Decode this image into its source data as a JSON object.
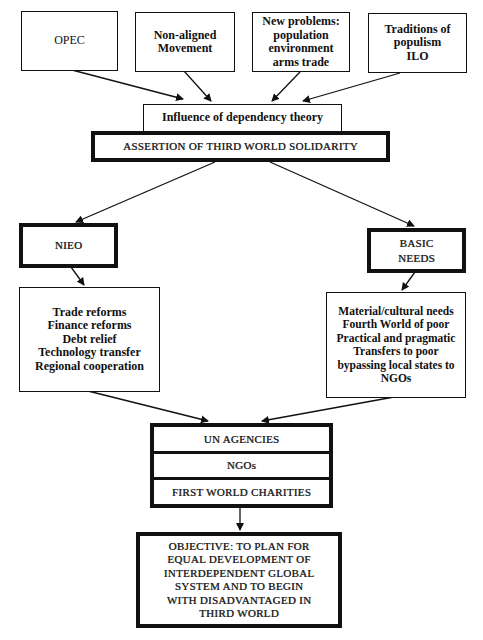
{
  "diagram": {
    "top_sources": [
      {
        "id": "opec",
        "lines": [
          "OPEC"
        ]
      },
      {
        "id": "non-aligned",
        "lines": [
          "Non-aligned",
          "Movement"
        ]
      },
      {
        "id": "new-problems",
        "lines": [
          "New problems:",
          "population",
          "environment",
          "arms trade"
        ]
      },
      {
        "id": "populism",
        "lines": [
          "Traditions of",
          "populism",
          "ILO"
        ]
      }
    ],
    "influence": {
      "label": "Influence of dependency theory"
    },
    "assertion": {
      "label": "ASSERTION OF THIRD WORLD SOLIDARITY"
    },
    "branches": {
      "left": {
        "title": "NIEO",
        "items": [
          "Trade reforms",
          "Finance reforms",
          "Debt relief",
          "Technology transfer",
          "Regional cooperation"
        ]
      },
      "right": {
        "title_lines": [
          "BASIC",
          "NEEDS"
        ],
        "items": [
          "Material/cultural needs",
          "Fourth World of poor",
          "Practical and pragmatic",
          "Transfers to poor",
          "bypassing local states to",
          "NGOs"
        ]
      }
    },
    "agents": [
      "UN AGENCIES",
      "NGOs",
      "FIRST WORLD CHARITIES"
    ],
    "objective": {
      "lines": [
        "OBJECTIVE: TO PLAN FOR",
        "EQUAL DEVELOPMENT OF",
        "INTERDEPENDENT GLOBAL",
        "SYSTEM AND TO BEGIN",
        "WITH DISADVANTAGED IN",
        "THIRD WORLD"
      ]
    }
  }
}
